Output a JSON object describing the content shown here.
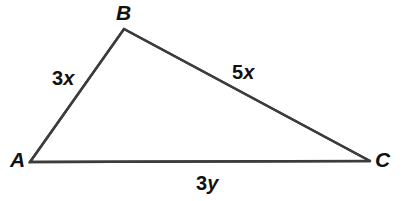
{
  "figure": {
    "type": "triangle-diagram",
    "background_color": "#ffffff",
    "stroke_color": "#3c3c3c",
    "stroke_width": 2.4,
    "text_color": "#111111"
  },
  "vertices": [
    {
      "name": "A",
      "label": "A",
      "x": 30,
      "y": 162
    },
    {
      "name": "B",
      "label": "B",
      "x": 124,
      "y": 29
    },
    {
      "name": "C",
      "label": "C",
      "x": 370,
      "y": 161
    }
  ],
  "sides": [
    {
      "name": "AB",
      "from": "A",
      "to": "B",
      "label": "3x",
      "coefficient": "3",
      "variable": "x"
    },
    {
      "name": "BC",
      "from": "B",
      "to": "C",
      "label": "5x",
      "coefficient": "5",
      "variable": "x"
    },
    {
      "name": "AC",
      "from": "A",
      "to": "C",
      "label": "3y",
      "coefficient": "3",
      "variable": "y"
    }
  ],
  "labels": {
    "vertex_A": "A",
    "vertex_B": "B",
    "vertex_C": "C",
    "side_AB_coefficient": "3",
    "side_AB_variable": "x",
    "side_BC_coefficient": "5",
    "side_BC_variable": "x",
    "side_AC_coefficient": "3",
    "side_AC_variable": "y"
  }
}
